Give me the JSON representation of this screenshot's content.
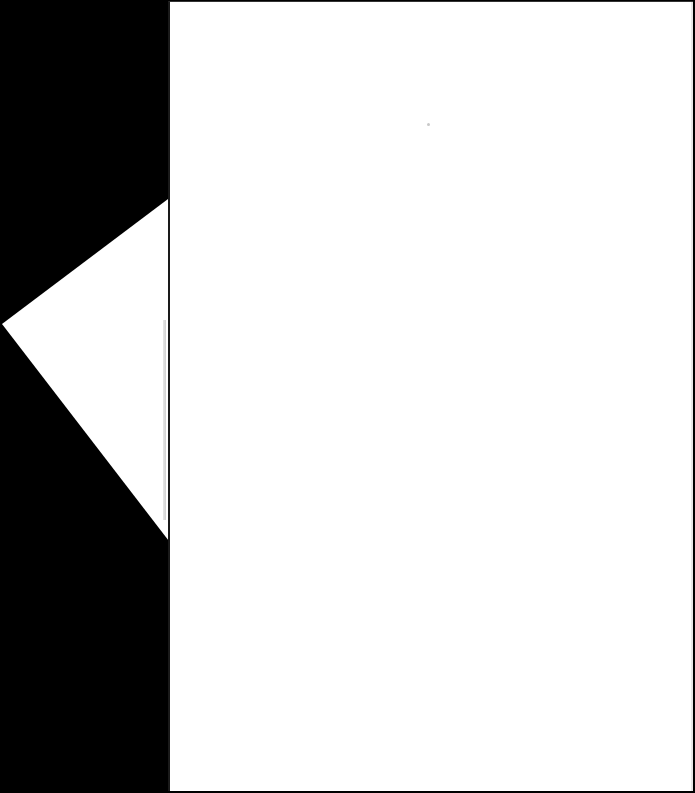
{
  "scene": {
    "description": "Blank white sheets of paper photographed on a black background",
    "background_color": "#000000",
    "paper_color": "#ffffff",
    "sheets": [
      {
        "id": "back",
        "shape": "triangle-corner",
        "visible_text": ""
      },
      {
        "id": "front",
        "shape": "rectangle",
        "visible_text": ""
      }
    ]
  }
}
